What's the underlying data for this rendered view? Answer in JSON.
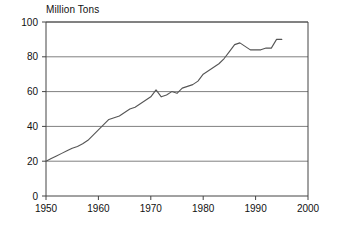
{
  "chart_data": {
    "type": "line",
    "title": "Million Tons",
    "xlabel": "",
    "ylabel": "Million Tons",
    "xlim": [
      1950,
      2000
    ],
    "ylim": [
      0,
      100
    ],
    "yticks": [
      0,
      20,
      40,
      60,
      80,
      100
    ],
    "xticks": [
      1950,
      1960,
      1970,
      1980,
      1990,
      2000
    ],
    "grid": "horizontal",
    "legend": "none",
    "line_color": "#555555",
    "grid_color": "#808080",
    "axis_color": "#444444",
    "background": "#ffffff",
    "series": [
      {
        "name": "Production",
        "x": [
          1950,
          1951,
          1952,
          1953,
          1954,
          1955,
          1956,
          1957,
          1958,
          1959,
          1960,
          1961,
          1962,
          1963,
          1964,
          1965,
          1966,
          1967,
          1968,
          1969,
          1970,
          1971,
          1972,
          1973,
          1974,
          1975,
          1976,
          1977,
          1978,
          1979,
          1980,
          1981,
          1982,
          1983,
          1984,
          1985,
          1986,
          1987,
          1988,
          1989,
          1990,
          1991,
          1992,
          1993,
          1994,
          1995
        ],
        "values": [
          20,
          21.5,
          23,
          24.5,
          26,
          27.5,
          28.5,
          30,
          32,
          35,
          38,
          41,
          44,
          45,
          46,
          48,
          50,
          51,
          53,
          55,
          57,
          61,
          57,
          58,
          60,
          59,
          62,
          63,
          64,
          66,
          70,
          72,
          74,
          76,
          79,
          83,
          87,
          88,
          86,
          84,
          84,
          84,
          85,
          85,
          90,
          90
        ]
      }
    ]
  }
}
